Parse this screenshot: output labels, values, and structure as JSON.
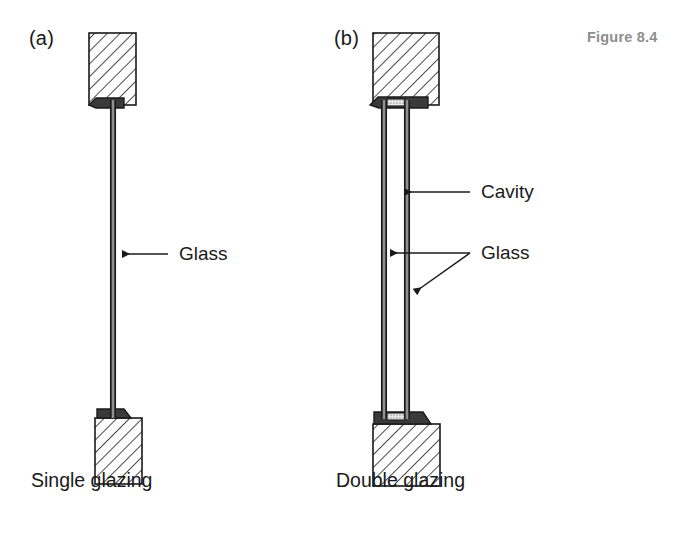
{
  "figure": {
    "number_label": "Figure 8.4",
    "number_color": "#8e8e8e"
  },
  "panels": [
    {
      "letter": "(a)",
      "caption": "Single glazing",
      "annotations": [
        {
          "text": "Glass",
          "target": "glass-pane"
        }
      ],
      "structure": {
        "panes": 1,
        "cavity": false,
        "masonry_blocks": 2
      }
    },
    {
      "letter": "(b)",
      "caption": "Double glazing",
      "annotations": [
        {
          "text": "Cavity",
          "target": "cavity-gap"
        },
        {
          "text": "Glass",
          "target": "glass-panes-both"
        }
      ],
      "structure": {
        "panes": 2,
        "cavity": true,
        "masonry_blocks": 2,
        "spacer": "stippled-spacer"
      }
    }
  ],
  "icons": {
    "arrow_left": "arrow-left-icon",
    "arrow_diagonal": "arrow-diagonal-down-left-icon"
  },
  "colors": {
    "line": "#1a1a1a",
    "hatch": "#2b2b2b",
    "glass_fill": "#8f8f8f",
    "glass_edge": "#1a1a1a",
    "spacer_fill": "#d8d8d8",
    "background": "#ffffff",
    "text": "#1a1a1a",
    "figure_label": "#8e8e8e"
  }
}
